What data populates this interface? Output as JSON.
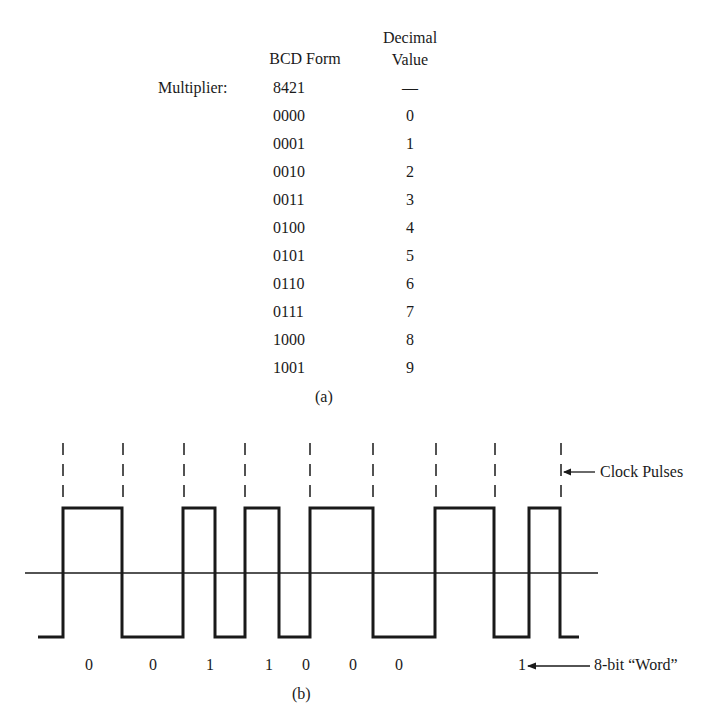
{
  "table_a": {
    "headers": {
      "bcd": "BCD Form",
      "decimal_line1": "Decimal",
      "decimal_line2": "Value"
    },
    "multiplier": {
      "label": "Multiplier:",
      "bcd": "8421",
      "decimal": "—"
    },
    "rows": [
      {
        "bcd": "0000",
        "decimal": "0"
      },
      {
        "bcd": "0001",
        "decimal": "1"
      },
      {
        "bcd": "0010",
        "decimal": "2"
      },
      {
        "bcd": "0011",
        "decimal": "3"
      },
      {
        "bcd": "0100",
        "decimal": "4"
      },
      {
        "bcd": "0101",
        "decimal": "5"
      },
      {
        "bcd": "0110",
        "decimal": "6"
      },
      {
        "bcd": "0111",
        "decimal": "7"
      },
      {
        "bcd": "1000",
        "decimal": "8"
      },
      {
        "bcd": "1001",
        "decimal": "9"
      }
    ],
    "caption": "(a)"
  },
  "waveform_b": {
    "clock_label": "Clock Pulses",
    "word_label": "8-bit “Word”",
    "bits": [
      "0",
      "0",
      "1",
      "1",
      "0",
      "0",
      "0",
      "1"
    ],
    "caption": "(b)"
  }
}
